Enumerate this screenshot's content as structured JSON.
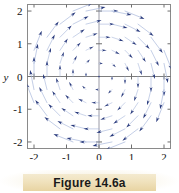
{
  "figure": {
    "caption": "Figure 14.6a",
    "caption_band_color": "#f0e2bd"
  },
  "chart_data": {
    "type": "scatter",
    "subtype": "vector-field-quiver",
    "title": "",
    "xlabel": "x",
    "ylabel": "y",
    "xlim": [
      -2.2,
      2.2
    ],
    "ylim": [
      -2.2,
      2.2
    ],
    "xticks": [
      -2,
      -1,
      0,
      1,
      2
    ],
    "yticks": [
      -2,
      -1,
      0,
      1,
      2
    ],
    "xtick_labels": [
      "-2",
      "-1",
      "0",
      "1",
      "2"
    ],
    "ytick_labels": [
      "-2",
      "-1",
      "0",
      "1",
      "2"
    ],
    "grid": false,
    "legend": null,
    "axes_style": "crosshair-with-box-frame",
    "arrow_color": "#2a3b7d",
    "arrow_tail_color": "#9fb0d8",
    "field_formula": "F(x, y) = (y, -x)",
    "field_description": "Clockwise rotational vector field; arrow length grows with distance from origin.",
    "sample_step": 0.4,
    "sample_min": -2.0,
    "sample_max": 2.0,
    "arrow_scale": 0.3,
    "radius_cutoff": 2.25
  }
}
